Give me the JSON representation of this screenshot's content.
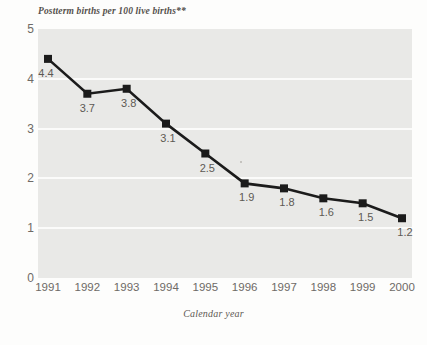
{
  "chart_data": {
    "type": "line",
    "title": "",
    "ylabel": "Postterm births per 100 live births**",
    "xlabel": "Calendar year",
    "categories": [
      "1991",
      "1992",
      "1993",
      "1994",
      "1995",
      "1996",
      "1997",
      "1998",
      "1999",
      "2000"
    ],
    "values": [
      4.4,
      3.7,
      3.8,
      3.1,
      2.5,
      1.9,
      1.8,
      1.6,
      1.5,
      1.2
    ],
    "point_labels": [
      "4.4",
      "3.7",
      "3.8",
      "3.1",
      "2.5",
      "1.9",
      "1.8",
      "1.6",
      "1.5",
      "1.2"
    ],
    "ylim": [
      0,
      5
    ],
    "y_ticks": [
      "0",
      "1",
      "2",
      "3",
      "4",
      "5"
    ],
    "y_tick_values": [
      0,
      1,
      2,
      3,
      4,
      5
    ],
    "grid": true,
    "grid_axis": "y",
    "legend": "none",
    "series_name": "Postterm births per 100 live births",
    "marker": "square",
    "colors": {
      "line": "#1b1b1b",
      "marker": "#1b1b1b",
      "plot_background": "#e9e9e7",
      "gridline": "#fbfbfa",
      "figure_background": "#fdfdfc",
      "tick_label": "#6e6a66",
      "data_label": "#5d5954",
      "axis_title": "#55514d"
    }
  }
}
